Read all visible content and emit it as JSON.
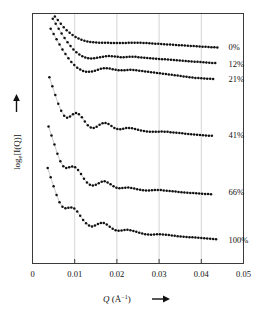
{
  "chart_data": {
    "type": "scatter",
    "title": "",
    "xlabel": "Q (Å⁻¹)",
    "ylabel": "log e[I(Q)]",
    "xlim": [
      0,
      0.05
    ],
    "ylim": [
      0,
      6.6
    ],
    "grid": "vertical",
    "xticks": [
      "0",
      "0.01",
      "0.02",
      "0.03",
      "0.04",
      "0.05"
    ],
    "xtick_values": [
      0,
      0.01,
      0.02,
      0.03,
      0.04,
      0.05
    ],
    "yticks": [],
    "legend_position": "right-inline",
    "marker": "filled-circle",
    "line": "thin-grey-connector",
    "series": [
      {
        "name": "0%",
        "label": "0%",
        "label_x": 0.0455,
        "label_y": 5.72,
        "x": [
          0.0053,
          0.006,
          0.0067,
          0.0074,
          0.0081,
          0.0088,
          0.0095,
          0.0102,
          0.0109,
          0.0116,
          0.0123,
          0.013,
          0.0137,
          0.0144,
          0.0151,
          0.0158,
          0.0165,
          0.0172,
          0.0179,
          0.0186,
          0.0193,
          0.02,
          0.0207,
          0.0214,
          0.0221,
          0.0228,
          0.0235,
          0.0242,
          0.0249,
          0.0256,
          0.0263,
          0.027,
          0.0277,
          0.0284,
          0.0291,
          0.0298,
          0.0305,
          0.0312,
          0.0319,
          0.0326,
          0.0333,
          0.034,
          0.0347,
          0.0354,
          0.0361,
          0.0368,
          0.0375,
          0.0382,
          0.0389,
          0.0396,
          0.0403,
          0.041,
          0.0417,
          0.0424,
          0.0431,
          0.0438
        ],
        "y": [
          6.52,
          6.43,
          6.33,
          6.24,
          6.16,
          6.09,
          6.03,
          5.98,
          5.94,
          5.91,
          5.88,
          5.86,
          5.85,
          5.84,
          5.835,
          5.83,
          5.828,
          5.826,
          5.825,
          5.824,
          5.823,
          5.822,
          5.822,
          5.823,
          5.824,
          5.826,
          5.827,
          5.828,
          5.827,
          5.825,
          5.822,
          5.818,
          5.814,
          5.809,
          5.804,
          5.799,
          5.794,
          5.789,
          5.784,
          5.779,
          5.774,
          5.769,
          5.764,
          5.759,
          5.754,
          5.749,
          5.744,
          5.739,
          5.734,
          5.729,
          5.724,
          5.719,
          5.715,
          5.711,
          5.708,
          5.705
        ]
      },
      {
        "name": "12%",
        "label": "12%",
        "label_x": 0.0455,
        "label_y": 5.27,
        "x": [
          0.0048,
          0.0055,
          0.0062,
          0.0069,
          0.0076,
          0.0083,
          0.009,
          0.0097,
          0.0104,
          0.0111,
          0.0118,
          0.0125,
          0.0132,
          0.0139,
          0.0146,
          0.0153,
          0.016,
          0.0167,
          0.0174,
          0.0181,
          0.0188,
          0.0195,
          0.0202,
          0.0209,
          0.0216,
          0.0223,
          0.023,
          0.0237,
          0.0244,
          0.0251,
          0.0258,
          0.0265,
          0.0272,
          0.0279,
          0.0286,
          0.0293,
          0.03,
          0.0307,
          0.0314,
          0.0321,
          0.0328,
          0.0335,
          0.0342,
          0.0349,
          0.0356,
          0.0363,
          0.037,
          0.0377,
          0.0384,
          0.0391,
          0.0398,
          0.0405,
          0.0412,
          0.0419,
          0.0426,
          0.0433
        ],
        "y": [
          6.46,
          6.33,
          6.2,
          6.07,
          5.95,
          5.84,
          5.74,
          5.65,
          5.58,
          5.52,
          5.47,
          5.44,
          5.42,
          5.415,
          5.42,
          5.43,
          5.445,
          5.46,
          5.47,
          5.475,
          5.472,
          5.465,
          5.455,
          5.448,
          5.446,
          5.45,
          5.455,
          5.458,
          5.455,
          5.448,
          5.44,
          5.432,
          5.425,
          5.419,
          5.413,
          5.407,
          5.401,
          5.395,
          5.389,
          5.383,
          5.377,
          5.371,
          5.365,
          5.359,
          5.353,
          5.347,
          5.341,
          5.335,
          5.329,
          5.323,
          5.317,
          5.311,
          5.305,
          5.3,
          5.295,
          5.29
        ]
      },
      {
        "name": "21%",
        "label": "21%",
        "label_x": 0.0455,
        "label_y": 4.87,
        "x": [
          0.0043,
          0.005,
          0.0057,
          0.0064,
          0.0071,
          0.0078,
          0.0085,
          0.0092,
          0.0099,
          0.0106,
          0.0113,
          0.012,
          0.0127,
          0.0134,
          0.0141,
          0.0148,
          0.0155,
          0.0162,
          0.0169,
          0.0176,
          0.0183,
          0.019,
          0.0197,
          0.0204,
          0.0211,
          0.0218,
          0.0225,
          0.0232,
          0.0239,
          0.0246,
          0.0253,
          0.026,
          0.0267,
          0.0274,
          0.0281,
          0.0288,
          0.0295,
          0.0302,
          0.0309,
          0.0316,
          0.0323,
          0.033,
          0.0337,
          0.0344,
          0.0351,
          0.0358,
          0.0365,
          0.0372,
          0.0379,
          0.0386,
          0.0393,
          0.04,
          0.0407,
          0.0414,
          0.0421,
          0.0428
        ],
        "y": [
          6.2,
          6.06,
          5.92,
          5.78,
          5.65,
          5.53,
          5.42,
          5.32,
          5.24,
          5.17,
          5.12,
          5.085,
          5.065,
          5.06,
          5.07,
          5.09,
          5.115,
          5.14,
          5.155,
          5.155,
          5.145,
          5.13,
          5.115,
          5.105,
          5.1,
          5.102,
          5.108,
          5.112,
          5.11,
          5.1,
          5.09,
          5.08,
          5.07,
          5.06,
          5.05,
          5.04,
          5.03,
          5.02,
          5.01,
          5.0,
          4.99,
          4.98,
          4.97,
          4.96,
          4.95,
          4.94,
          4.93,
          4.92,
          4.91,
          4.9,
          4.895,
          4.89,
          4.885,
          4.88,
          4.875,
          4.87
        ]
      },
      {
        "name": "41%",
        "label": "41%",
        "label_x": 0.0455,
        "label_y": 3.38,
        "x": [
          0.004,
          0.0047,
          0.0054,
          0.0061,
          0.0068,
          0.0075,
          0.0082,
          0.0089,
          0.0096,
          0.0103,
          0.011,
          0.0117,
          0.0124,
          0.0131,
          0.0138,
          0.0145,
          0.0152,
          0.0159,
          0.0166,
          0.0173,
          0.018,
          0.0187,
          0.0194,
          0.0201,
          0.0208,
          0.0215,
          0.0222,
          0.0229,
          0.0236,
          0.0243,
          0.025,
          0.0257,
          0.0264,
          0.0271,
          0.0278,
          0.0285,
          0.0292,
          0.0299,
          0.0306,
          0.0313,
          0.032,
          0.0327,
          0.0334,
          0.0341,
          0.0348,
          0.0355,
          0.0362,
          0.0369,
          0.0376,
          0.0383,
          0.039,
          0.0397,
          0.0404,
          0.0411,
          0.0418,
          0.0425
        ],
        "y": [
          4.92,
          4.68,
          4.45,
          4.22,
          4.03,
          3.9,
          3.85,
          3.88,
          3.94,
          3.97,
          3.94,
          3.86,
          3.75,
          3.65,
          3.59,
          3.58,
          3.61,
          3.66,
          3.7,
          3.71,
          3.68,
          3.63,
          3.58,
          3.55,
          3.545,
          3.56,
          3.575,
          3.58,
          3.57,
          3.55,
          3.53,
          3.51,
          3.495,
          3.485,
          3.48,
          3.478,
          3.478,
          3.48,
          3.482,
          3.48,
          3.475,
          3.468,
          3.46,
          3.452,
          3.444,
          3.436,
          3.428,
          3.42,
          3.412,
          3.404,
          3.398,
          3.392,
          3.386,
          3.38,
          3.375,
          3.37
        ]
      },
      {
        "name": "66%",
        "label": "66%",
        "label_x": 0.0455,
        "label_y": 1.88,
        "x": [
          0.0038,
          0.0045,
          0.0052,
          0.0059,
          0.0066,
          0.0073,
          0.008,
          0.0087,
          0.0094,
          0.0101,
          0.0108,
          0.0115,
          0.0122,
          0.0129,
          0.0136,
          0.0143,
          0.015,
          0.0157,
          0.0164,
          0.0171,
          0.0178,
          0.0185,
          0.0192,
          0.0199,
          0.0206,
          0.0213,
          0.022,
          0.0227,
          0.0234,
          0.0241,
          0.0248,
          0.0255,
          0.0262,
          0.0269,
          0.0276,
          0.0283,
          0.029,
          0.0297,
          0.0304,
          0.0311,
          0.0318,
          0.0325,
          0.0332,
          0.0339,
          0.0346,
          0.0353,
          0.036,
          0.0367,
          0.0374,
          0.0381,
          0.0388,
          0.0395,
          0.0402,
          0.0409,
          0.0416,
          0.0423
        ],
        "y": [
          3.62,
          3.38,
          3.14,
          2.9,
          2.7,
          2.57,
          2.52,
          2.54,
          2.56,
          2.54,
          2.47,
          2.36,
          2.24,
          2.14,
          2.08,
          2.06,
          2.08,
          2.12,
          2.16,
          2.17,
          2.14,
          2.09,
          2.04,
          2.0,
          1.985,
          1.99,
          2.0,
          2.005,
          1.995,
          1.98,
          1.96,
          1.945,
          1.935,
          1.93,
          1.93,
          1.935,
          1.94,
          1.942,
          1.938,
          1.93,
          1.922,
          1.914,
          1.906,
          1.898,
          1.89,
          1.882,
          1.876,
          1.87,
          1.864,
          1.858,
          1.852,
          1.846,
          1.842,
          1.838,
          1.834,
          1.83
        ]
      },
      {
        "name": "100%",
        "label": "100%",
        "label_x": 0.0455,
        "label_y": 0.62,
        "x": [
          0.0036,
          0.0043,
          0.005,
          0.0057,
          0.0064,
          0.0071,
          0.0078,
          0.0085,
          0.0092,
          0.0099,
          0.0106,
          0.0113,
          0.012,
          0.0127,
          0.0134,
          0.0141,
          0.0148,
          0.0155,
          0.0162,
          0.0169,
          0.0176,
          0.0183,
          0.019,
          0.0197,
          0.0204,
          0.0211,
          0.0218,
          0.0225,
          0.0232,
          0.0239,
          0.0246,
          0.0253,
          0.026,
          0.0267,
          0.0274,
          0.0281,
          0.0288,
          0.0295,
          0.0302,
          0.0309,
          0.0316,
          0.0323,
          0.033,
          0.0337,
          0.0344,
          0.0351,
          0.0358,
          0.0365,
          0.0372,
          0.0379,
          0.0386,
          0.0393,
          0.04,
          0.0407,
          0.0414,
          0.0421,
          0.0428,
          0.0435
        ],
        "y": [
          2.52,
          2.28,
          2.04,
          1.81,
          1.62,
          1.5,
          1.46,
          1.47,
          1.48,
          1.45,
          1.37,
          1.26,
          1.15,
          1.06,
          1.0,
          0.98,
          1.0,
          1.04,
          1.07,
          1.07,
          1.03,
          0.97,
          0.92,
          0.88,
          0.865,
          0.87,
          0.885,
          0.89,
          0.88,
          0.86,
          0.835,
          0.81,
          0.79,
          0.775,
          0.765,
          0.762,
          0.765,
          0.77,
          0.772,
          0.768,
          0.76,
          0.75,
          0.74,
          0.73,
          0.722,
          0.715,
          0.708,
          0.702,
          0.696,
          0.69,
          0.684,
          0.678,
          0.672,
          0.666,
          0.66,
          0.654,
          0.648,
          0.642
        ]
      }
    ]
  },
  "axis": {
    "x_label_symbol": "Q",
    "x_label_unit_open": " (Å",
    "x_label_unit_exp": "−1",
    "x_label_unit_close": ")",
    "x_label_arrow": "➔",
    "y_label_log": "log",
    "y_label_base": "e",
    "y_label_rest": "[I(Q)]",
    "y_label_arrow": "➔"
  }
}
